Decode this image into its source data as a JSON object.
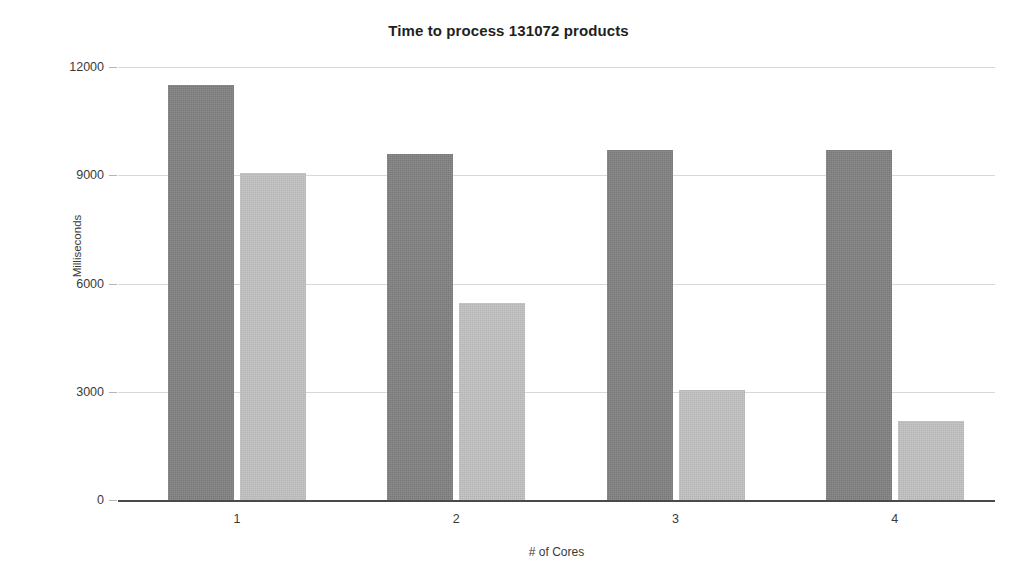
{
  "chart_data": {
    "type": "bar",
    "title": "Time to process 131072 products",
    "xlabel": "# of Cores",
    "ylabel": "Milliseconds",
    "categories": [
      "1",
      "2",
      "3",
      "4"
    ],
    "ylim": [
      0,
      12000
    ],
    "yticks": [
      0,
      3000,
      6000,
      9000,
      12000
    ],
    "ytick_labels": [
      "0",
      "3000",
      "6000",
      "9000",
      "12000"
    ],
    "grid": true,
    "legend": "none",
    "series": [
      {
        "name": "series-a",
        "color": "#818181",
        "values": [
          11500,
          9600,
          9700,
          9700
        ]
      },
      {
        "name": "series-b",
        "color": "#c2c2c2",
        "values": [
          9050,
          5450,
          3050,
          2200
        ]
      }
    ]
  },
  "chart": {
    "title": "Time to process 131072 products",
    "y_axis_title": "Milliseconds",
    "x_axis_title": "# of Cores",
    "y_ticks": [
      "12000",
      "9000",
      "6000",
      "3000",
      "0"
    ],
    "x_ticks": [
      "1",
      "2",
      "3",
      "4"
    ]
  }
}
